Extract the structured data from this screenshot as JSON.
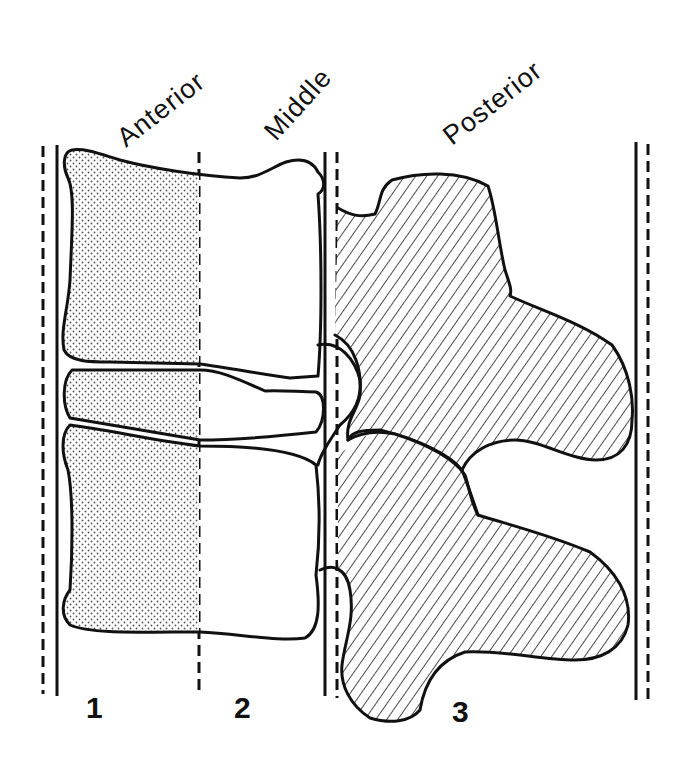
{
  "figure": {
    "columns": [
      {
        "number": "1",
        "label": "Anterior"
      },
      {
        "number": "2",
        "label": "Middle"
      },
      {
        "number": "3",
        "label": "Posterior"
      }
    ],
    "fills": {
      "anterior": "stippled (dotted)",
      "middle": "blank",
      "posterior": "diagonal hatching"
    },
    "colors": {
      "ink": "#111111",
      "background": "#ffffff",
      "stipple": "#555555"
    }
  }
}
